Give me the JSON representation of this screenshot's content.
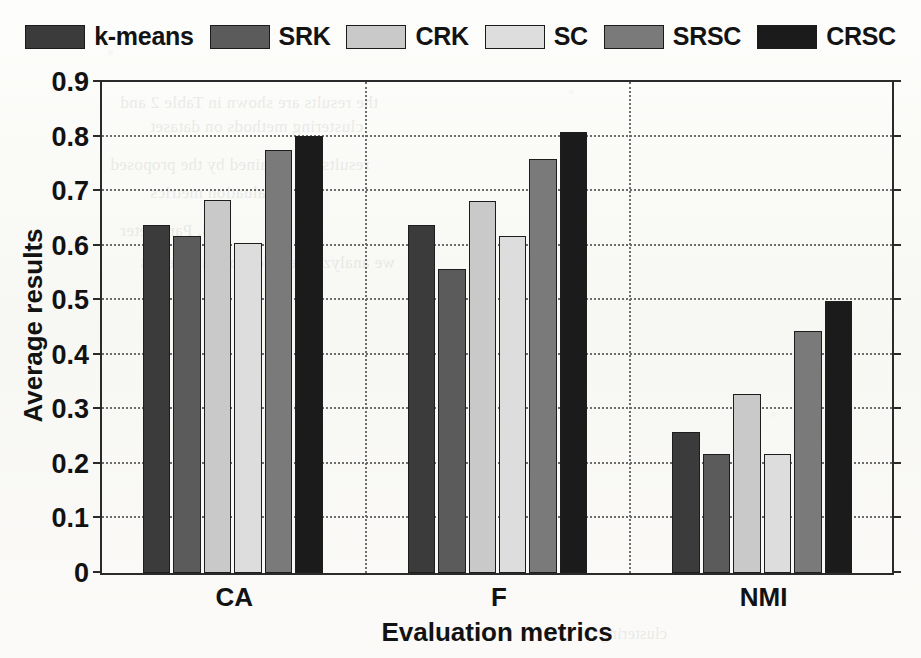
{
  "chart_data": {
    "type": "bar",
    "title": "",
    "xlabel": "Evaluation metrics",
    "ylabel": "Average results",
    "categories": [
      "CA",
      "F",
      "NMI"
    ],
    "ylim": [
      0,
      0.9
    ],
    "yticks": [
      "0",
      "0.1",
      "0.2",
      "0.3",
      "0.4",
      "0.5",
      "0.6",
      "0.7",
      "0.8",
      "0.9"
    ],
    "ytick_values": [
      0,
      0.1,
      0.2,
      0.3,
      0.4,
      0.5,
      0.6,
      0.7,
      0.8,
      0.9
    ],
    "grid": "horizontal-dotted",
    "legend_position": "top-outside",
    "series": [
      {
        "name": "k-means",
        "color": "#3b3b3b",
        "values": [
          0.637,
          0.637,
          0.259
        ]
      },
      {
        "name": "SRK",
        "color": "#5b5b5b",
        "values": [
          0.617,
          0.557,
          0.219
        ]
      },
      {
        "name": "CRK",
        "color": "#c9c9c9",
        "values": [
          0.683,
          0.682,
          0.329
        ]
      },
      {
        "name": "SC",
        "color": "#dddddd",
        "values": [
          0.605,
          0.617,
          0.219
        ]
      },
      {
        "name": "SRSC",
        "color": "#7a7a7a",
        "values": [
          0.775,
          0.758,
          0.443
        ]
      },
      {
        "name": "CRSC",
        "color": "#1b1b1b",
        "values": [
          0.801,
          0.808,
          0.498
        ]
      }
    ]
  },
  "legend": {
    "items": [
      {
        "label": "k-means",
        "color": "#3b3b3b"
      },
      {
        "label": "SRK",
        "color": "#5b5b5b"
      },
      {
        "label": "CRK",
        "color": "#c9c9c9"
      },
      {
        "label": "SC",
        "color": "#dddddd"
      },
      {
        "label": "SRSC",
        "color": "#7a7a7a"
      },
      {
        "label": "CRSC",
        "color": "#1b1b1b"
      }
    ]
  },
  "axes": {
    "x_title": "Evaluation metrics",
    "y_title": "Average results"
  }
}
